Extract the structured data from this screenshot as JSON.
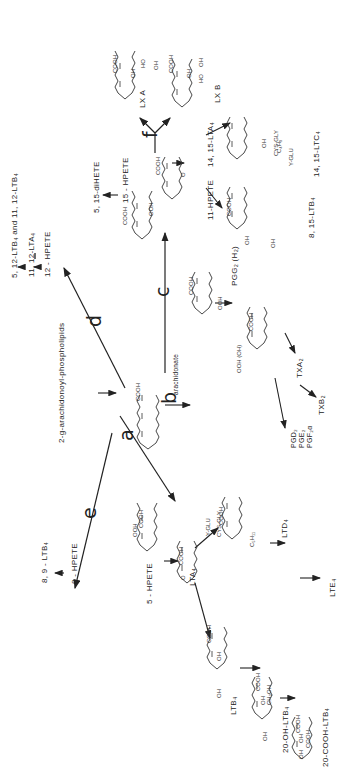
{
  "figure": {
    "orientation": "rotated 90 degrees counter-clockwise"
  },
  "source": {
    "label": "2-sn-arachidonoyl-phospholipids",
    "display": "2-g-arachidonoyl-phospholipids"
  },
  "center": {
    "label": "arachidonate"
  },
  "steps": {
    "a": "a",
    "b": "b",
    "c": "c",
    "d": "d",
    "e": "e",
    "f": "f"
  },
  "pathway_d": {
    "nodes": [
      "12-HPETE",
      "11,12-LTA4",
      "5,12-LTB4 and 11,12-LTB4"
    ],
    "labels": {
      "hpete": "12 - HPETE",
      "lta4": "11, 12-LTA₄",
      "ltb4": "5, 12-LTB₄ and 11, 12-LTB₄"
    }
  },
  "pathway_c": {
    "labels": {
      "hpete": "15 - HPETE",
      "dihete": "5, 15-diHETE",
      "lta4": "14, 15-LTA₄",
      "ltb4": "8, 15-LTB₄",
      "ltc4": "14, 15-LTC₄"
    },
    "ltc4_substituents": [
      "C₄H₉",
      "OH",
      "CYS-GLY",
      "Y-GLU"
    ]
  },
  "pathway_f": {
    "labels": {
      "lxa": "LX A",
      "lxb": "LX B"
    }
  },
  "pathway_b": {
    "labels": {
      "hpete": "11-HPETE",
      "pgg2": "PGG₂ (H₂)",
      "pgg2_sub": "OOH (OH)",
      "txa2": "TXA₂",
      "txb2": "TXB₂"
    },
    "prostaglandins": [
      "PGD₂",
      "PGE₂",
      "PGF₂α"
    ]
  },
  "pathway_e": {
    "labels": {
      "hpete": "8 - HPETE",
      "ltb4": "8, 9 - LTB₄"
    }
  },
  "pathway_a": {
    "labels": {
      "hpete": "5 - HPETE",
      "lta4": "LTA₄",
      "ltc4_subs": [
        "Y-GLU",
        "CYS-GLY",
        "C₅H₁₁"
      ],
      "ltd4": "LTD₄",
      "lte4": "LTE₄",
      "ltb4": "LTB₄",
      "oh_ltb4": "20-OH-LTB₄",
      "cooh_ltb4": "20-COOH-LTB₄"
    }
  },
  "groups": {
    "cooh": "COOH",
    "ooh": "OOH",
    "oh": "OH",
    "ho": "HO",
    "ch2oh": "CH₂OH",
    "o": "O"
  }
}
